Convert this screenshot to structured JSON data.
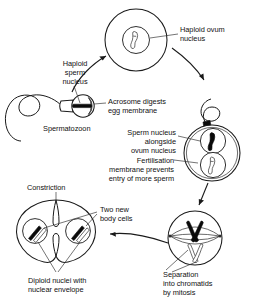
{
  "diagram": {
    "background_color": "#ffffff",
    "ink_color": "#1a1a1a",
    "labels": {
      "haploid_ovum_nucleus": "Haploid ovum\nnucleus",
      "haploid_sperm_nucleus": "Haploid\nsperm\nnucleus",
      "acrosome": "Acrosome digests\negg membrane",
      "spermatozoon": "Spermatozoon",
      "sperm_alongside_ovum": "Sperm nucleus\nalongside\novum nucleus",
      "fertilisation_membrane": "Fertilisation\nmembrane prevents\nentry of more sperm",
      "separation_mitosis": "Separation\ninto chromatids\nby mitosis",
      "constriction": "Constriction",
      "two_new_body_cells": "Two new\nbody cells",
      "diploid_nuclei": "Diploid nuclei with\nnuclear envelope"
    },
    "stages": [
      {
        "id": "ovum",
        "name": "Haploid ovum",
        "position": "top-centre",
        "nuclei": 1,
        "chromosomes": [
          {
            "style": "open",
            "shape": "rod"
          }
        ]
      },
      {
        "id": "spermatozoon",
        "name": "Spermatozoon",
        "position": "left",
        "parts": [
          "tail",
          "midpiece",
          "head",
          "acrosome",
          "nucleus"
        ],
        "chromosomes": [
          {
            "style": "solid",
            "shape": "bar"
          }
        ]
      },
      {
        "id": "fertilised-egg",
        "name": "Fertilised egg with two nuclei",
        "position": "right-middle",
        "nuclei": 2,
        "chromosomes": [
          {
            "style": "solid",
            "shape": "rod",
            "origin": "sperm"
          },
          {
            "style": "open",
            "shape": "rod",
            "origin": "ovum"
          }
        ]
      },
      {
        "id": "mitosis",
        "name": "Mitotic spindle",
        "position": "bottom-right",
        "spindle": true,
        "chromosomes": [
          {
            "style": "solid",
            "shape": "x"
          },
          {
            "style": "open",
            "shape": "x"
          }
        ]
      },
      {
        "id": "two-cell",
        "name": "Two new body cells",
        "position": "bottom-left",
        "nuclei": 2,
        "constrictions": 2,
        "chromosomes": [
          {
            "style": "solid",
            "shape": "rod"
          },
          {
            "style": "open",
            "shape": "rod"
          }
        ]
      }
    ],
    "flow": [
      {
        "from": "spermatozoon",
        "to": "ovum",
        "kind": "curved-arrow"
      },
      {
        "from": "ovum",
        "to": "fertilised-egg",
        "kind": "curved-arrow"
      },
      {
        "from": "fertilised-egg",
        "to": "mitosis",
        "kind": "straight-arrow"
      },
      {
        "from": "mitosis",
        "to": "two-cell",
        "kind": "curved-arrow"
      }
    ]
  }
}
